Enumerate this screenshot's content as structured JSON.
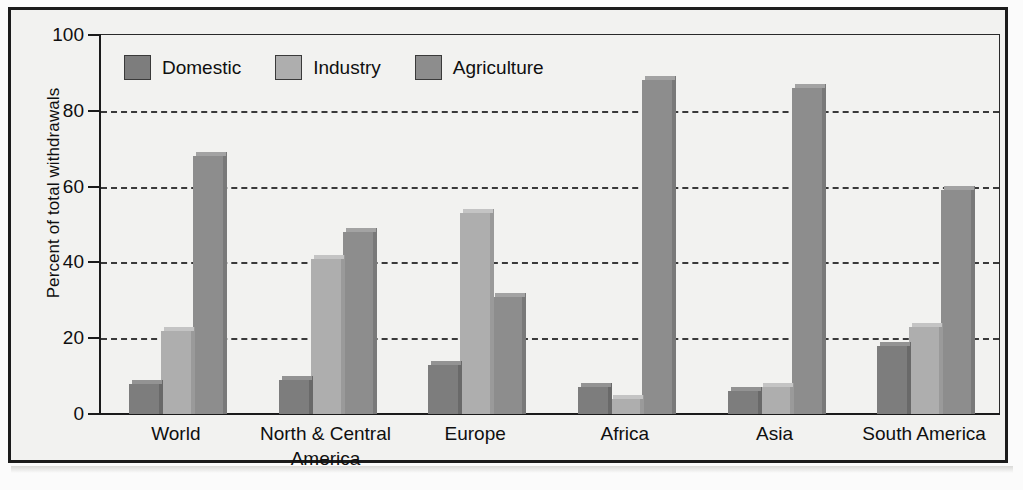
{
  "chart_data": {
    "type": "bar",
    "title": "",
    "subtitle": "",
    "xlabel": "",
    "ylabel": "Percent of total withdrawals",
    "ylim": [
      0,
      100
    ],
    "yticks": [
      0,
      20,
      40,
      60,
      80,
      100
    ],
    "ytick_labels": [
      "0",
      "20",
      "40",
      "60",
      "80",
      "100"
    ],
    "grid": "horizontal-dashed",
    "legend_position": "top-left-inside",
    "categories": [
      "World",
      "North & Central America",
      "Europe",
      "Africa",
      "Asia",
      "South America"
    ],
    "category_label_lines": [
      [
        "World"
      ],
      [
        "North & Central",
        "America"
      ],
      [
        "Europe"
      ],
      [
        "Africa"
      ],
      [
        "Asia"
      ],
      [
        "South America"
      ]
    ],
    "series": [
      {
        "name": "Domestic",
        "color": "#7d7d7d",
        "values": [
          8,
          9,
          13,
          7,
          6,
          18
        ]
      },
      {
        "name": "Industry",
        "color": "#aeaeae",
        "values": [
          22,
          41,
          53,
          4,
          7,
          23
        ]
      },
      {
        "name": "Agriculture",
        "color": "#8d8d8d",
        "values": [
          68,
          48,
          31,
          88,
          86,
          59
        ]
      }
    ]
  },
  "legend": {
    "items": [
      {
        "label": "Domestic",
        "color": "#7d7d7d"
      },
      {
        "label": "Industry",
        "color": "#aeaeae"
      },
      {
        "label": "Agriculture",
        "color": "#8d8d8d"
      }
    ]
  },
  "axes": {
    "y_title": "Percent of total withdrawals",
    "y_ticks": [
      "100",
      "80",
      "60",
      "40",
      "20",
      "0"
    ]
  },
  "colors": {
    "page_background": "#f2f2f0",
    "frame": "#1b1b1b",
    "axis": "#1b1b1b",
    "gridline": "#3a3a3a",
    "text": "#0f0f0f",
    "bar_top_shade": "#9b9b9b",
    "bar_side_shade": "#6b6b6b"
  }
}
